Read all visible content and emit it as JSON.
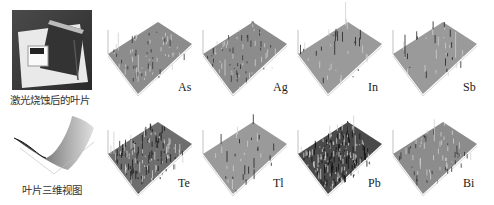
{
  "figure": {
    "photo_caption": "激光烧蚀后的叶片",
    "render_caption": "叶片三维视图",
    "element_maps": [
      {
        "element": "As",
        "style": "fine"
      },
      {
        "element": "Ag",
        "style": "fine"
      },
      {
        "element": "In",
        "style": "sparse"
      },
      {
        "element": "Sb",
        "style": "sparse"
      },
      {
        "element": "Te",
        "style": "dense"
      },
      {
        "element": "Tl",
        "style": "sparse"
      },
      {
        "element": "Pb",
        "style": "dark-dense"
      },
      {
        "element": "Bi",
        "style": "fine"
      }
    ]
  }
}
